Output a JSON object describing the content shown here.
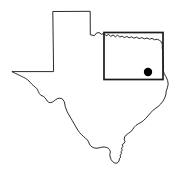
{
  "figure": {
    "title": "Texas",
    "subtitle": "",
    "caption": "",
    "width": 179,
    "height": 174,
    "background_color": "#ffffff"
  },
  "map": {
    "region_name": "Texas",
    "outline_color": "#111111",
    "outline_width": 0.9,
    "fill_color": "none",
    "projection_note": ""
  },
  "study_area": {
    "label": "",
    "shape": "rectangle",
    "stroke_color": "#1a1a1a",
    "stroke_width": 1.7,
    "fill_color": "none",
    "bounds": {
      "x": 104,
      "y": 32.5,
      "width": 59,
      "height": 47
    }
  },
  "markers": [
    {
      "name": "site-location",
      "label": "",
      "shape": "circle",
      "color": "#000000",
      "x": 148,
      "y": 72,
      "radius": 4.2
    }
  ],
  "legend": {
    "visible": false,
    "items": []
  },
  "chart_data": {
    "type": "map",
    "title": "Texas",
    "xlabel": "",
    "ylabel": "",
    "annotations": [
      {
        "type": "rectangle",
        "description": "study area box in northeast Texas",
        "x": 104,
        "y": 32.5,
        "width": 59,
        "height": 47
      },
      {
        "type": "point",
        "description": "filled circular site marker inside study area box",
        "x": 148,
        "y": 72
      }
    ]
  }
}
